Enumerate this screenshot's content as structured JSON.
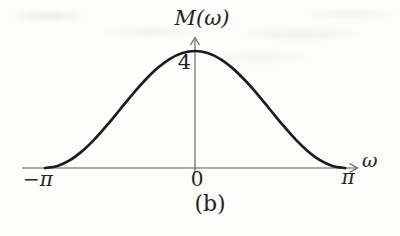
{
  "figure": {
    "caption": "(b)",
    "background_color": "#fcfcfb",
    "axis_color": "#5a5a5a",
    "curve_color": "#1c1c1c",
    "text_color": "#242424"
  },
  "chart_data": {
    "type": "line",
    "title": "M(ω)",
    "xlabel": "ω",
    "ylabel": "M(ω)",
    "function": "M(ω) = 2(1 + cos ω)",
    "xlim": [
      -3.1416,
      3.1416
    ],
    "ylim": [
      0,
      4.5
    ],
    "grid": false,
    "legend": false,
    "x_ticks": [
      {
        "value": -3.1416,
        "label": "−π"
      },
      {
        "value": 0,
        "label": "0"
      },
      {
        "value": 3.1416,
        "label": "π"
      }
    ],
    "y_ticks": [
      {
        "value": 4,
        "label": "4"
      }
    ],
    "series": [
      {
        "name": "M(ω)",
        "x": [
          -3.1416,
          -2.8798,
          -2.618,
          -2.3562,
          -2.0944,
          -1.8326,
          -1.5708,
          -1.309,
          -1.0472,
          -0.7854,
          -0.5236,
          -0.2618,
          0,
          0.2618,
          0.5236,
          0.7854,
          1.0472,
          1.309,
          1.5708,
          1.8326,
          2.0944,
          2.3562,
          2.618,
          2.8798,
          3.1416
        ],
        "y": [
          0,
          0.068,
          0.268,
          0.586,
          1.0,
          1.482,
          2.0,
          2.518,
          3.0,
          3.414,
          3.732,
          3.932,
          4.0,
          3.932,
          3.732,
          3.414,
          3.0,
          2.518,
          2.0,
          1.482,
          1.0,
          0.586,
          0.268,
          0.068,
          0
        ]
      }
    ]
  }
}
